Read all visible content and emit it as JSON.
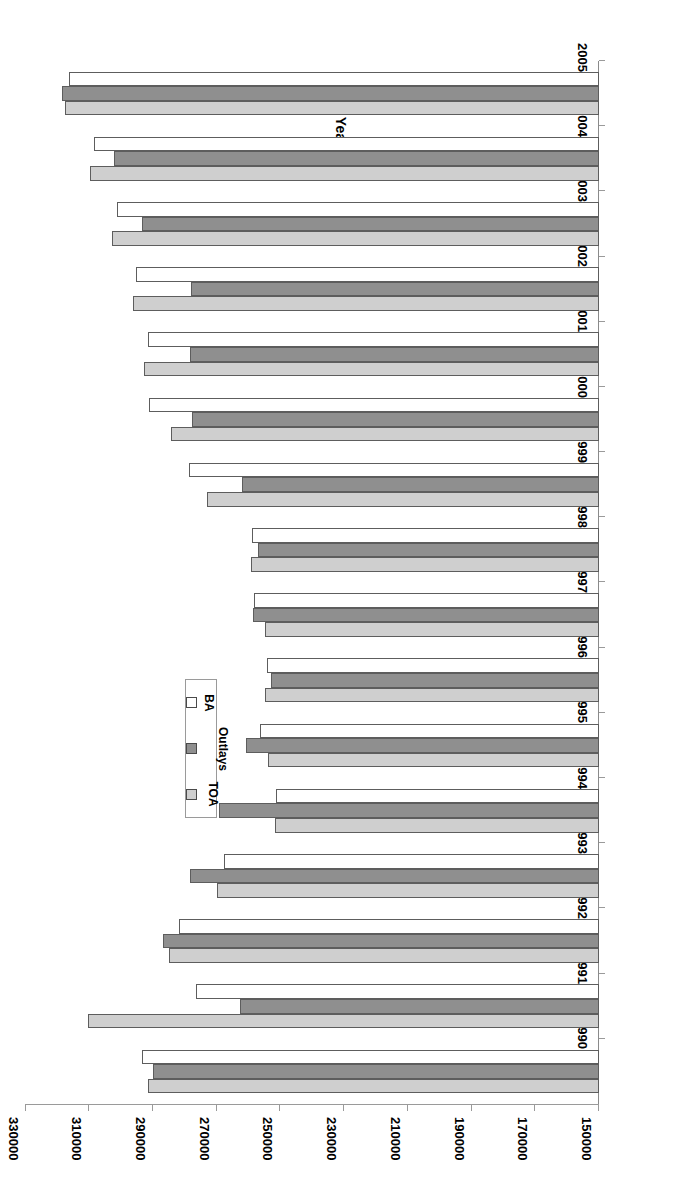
{
  "chart_data": {
    "type": "bar",
    "orientation": "horizontal",
    "title": "",
    "xlabel": "$ in Millions",
    "ylabel": "Fiscal Year",
    "xlim": [
      150000,
      330000
    ],
    "xticks": [
      150000,
      170000,
      190000,
      210000,
      230000,
      250000,
      270000,
      290000,
      310000,
      330000
    ],
    "xtick_labels": [
      "150000",
      "170000",
      "190000",
      "210000",
      "230000",
      "250000",
      "270000",
      "290000",
      "310000",
      "330000"
    ],
    "grid": false,
    "legend_position": "upper-right",
    "rotated_180": true,
    "categories": [
      "1990",
      "1991",
      "1992",
      "1993",
      "1994",
      "1995",
      "1996",
      "1997",
      "1998",
      "1999",
      "2000",
      "2001",
      "2002",
      "2003",
      "2004",
      "2005"
    ],
    "series": [
      {
        "name": "TOA",
        "color": "#cfcfcf",
        "values": [
          291500,
          310500,
          285000,
          270000,
          251700,
          253900,
          254900,
          254800,
          259400,
          273200,
          284400,
          293000,
          296300,
          302800,
          309800,
          317700
        ]
      },
      {
        "name": "Outlays",
        "color": "#8f8f8f",
        "values": [
          290100,
          262700,
          286800,
          278400,
          269300,
          260800,
          253000,
          258600,
          257000,
          262000,
          277800,
          278400,
          278100,
          293600,
          302300,
          318600
        ]
      },
      {
        "name": "BA",
        "color": "#ffffff",
        "values": [
          293400,
          276600,
          281800,
          267700,
          251400,
          256300,
          254200,
          258300,
          258900,
          278700,
          291200,
          291500,
          295300,
          301300,
          308400,
          316400
        ]
      }
    ]
  },
  "legend": {
    "entries": [
      {
        "label": "TOA",
        "swatch": "toa"
      },
      {
        "label": "Outlays",
        "swatch": "outlays"
      },
      {
        "label": "BA",
        "swatch": "ba"
      }
    ]
  },
  "axes": {
    "value_axis_title": "$ in Millions",
    "category_axis_title": "Fiscal Year"
  }
}
